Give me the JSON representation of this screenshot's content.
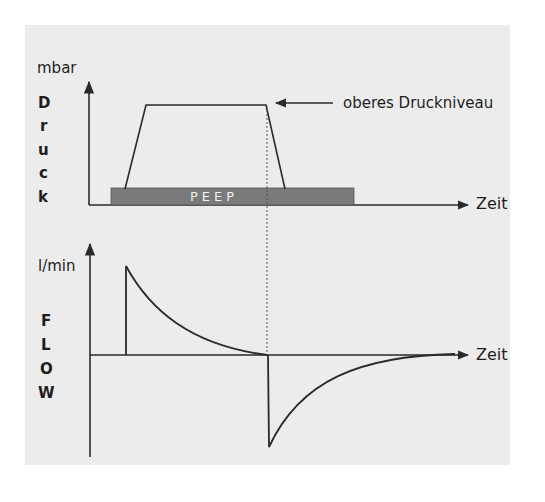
{
  "diagram": {
    "colors": {
      "background": "#ffffff",
      "paper": "#ececec",
      "line": "#2a2a2a",
      "peep_bar": "#7a7a7a",
      "peep_text": "#f2f2f2"
    },
    "pressure_panel": {
      "unit_label": "mbar",
      "vertical_label": [
        "D",
        "r",
        "u",
        "c",
        "k"
      ],
      "annotation": "oberes Druckniveau",
      "peep_label": "PEEP",
      "x_axis_label": "Zeit"
    },
    "flow_panel": {
      "unit_label": "l/min",
      "vertical_label": [
        "F",
        "L",
        "O",
        "W"
      ],
      "x_axis_label": "Zeit"
    }
  }
}
